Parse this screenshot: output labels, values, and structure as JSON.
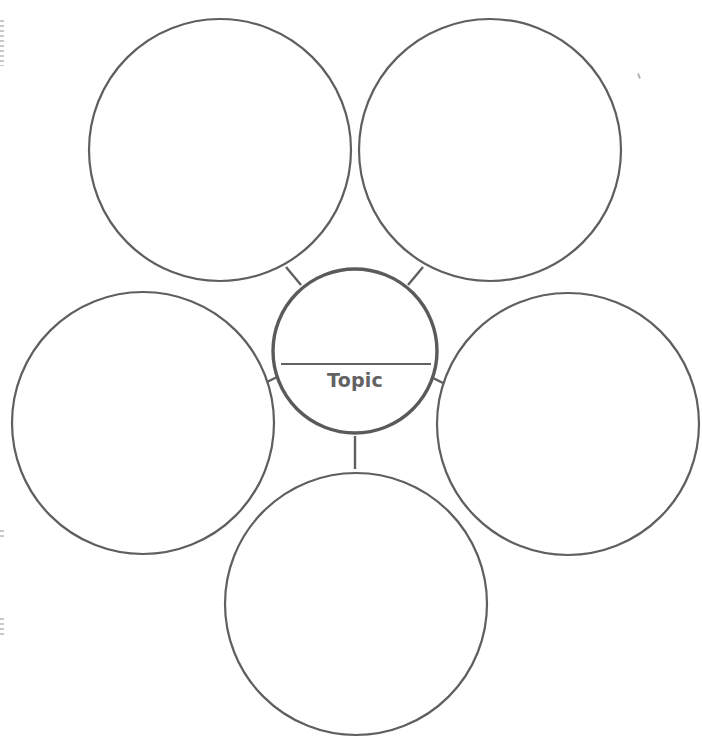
{
  "diagram": {
    "type": "bubble-map",
    "center": {
      "label": "Topic",
      "cx": 355,
      "cy": 351,
      "r": 82
    },
    "bubbles": [
      {
        "id": "top-left",
        "label": "",
        "cx": 220,
        "cy": 150,
        "r": 131
      },
      {
        "id": "top-right",
        "label": "",
        "cx": 490,
        "cy": 150,
        "r": 131
      },
      {
        "id": "left",
        "label": "",
        "cx": 143,
        "cy": 423,
        "r": 131
      },
      {
        "id": "right",
        "label": "",
        "cx": 568,
        "cy": 424,
        "r": 131
      },
      {
        "id": "bottom",
        "label": "",
        "cx": 356,
        "cy": 604,
        "r": 131
      }
    ],
    "colors": {
      "stroke": "#5f5f5f",
      "center_stroke": "#5a5a5a",
      "rule": "#2e2e2e",
      "label": "#626262",
      "background": "#ffffff"
    }
  }
}
